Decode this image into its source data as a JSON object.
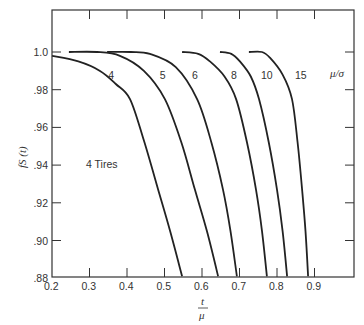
{
  "chart_data": {
    "type": "line",
    "title": "",
    "xlabel": "t/μ",
    "xlabel_num": "t",
    "xlabel_den": "μ",
    "ylabel": "fS (t)",
    "xlim": [
      0.2,
      1.005
    ],
    "ylim": [
      0.88,
      1.022
    ],
    "xticks": [
      0.2,
      0.3,
      0.4,
      0.5,
      0.6,
      0.7,
      0.8,
      0.9
    ],
    "xtick_labels": [
      "0.2",
      "0.3",
      "0.4",
      "0.5",
      "0.6",
      "0.7",
      "0.8",
      "0.9"
    ],
    "yticks": [
      1.0,
      0.98,
      0.96,
      0.94,
      0.92,
      0.9,
      0.88
    ],
    "ytick_labels": [
      "1.0",
      ".98",
      ".96",
      ".94",
      ".92",
      ".90",
      ".88"
    ],
    "grid": false,
    "legend_title": "μ/σ",
    "annotation": "4 Tires",
    "series": [
      {
        "name": "4",
        "label_pos": [
          0.35,
          0.988
        ],
        "x": [
          0.2,
          0.27,
          0.328,
          0.37,
          0.408,
          0.445,
          0.483,
          0.515,
          0.547
        ],
        "y": [
          0.998,
          0.995,
          0.99,
          0.983,
          0.975,
          0.953,
          0.927,
          0.905,
          0.881
        ]
      },
      {
        "name": "5",
        "label_pos": [
          0.487,
          0.988
        ],
        "x": [
          0.245,
          0.32,
          0.381,
          0.445,
          0.501,
          0.545,
          0.581,
          0.613,
          0.643
        ],
        "y": [
          1.0,
          1.0,
          0.998,
          0.99,
          0.975,
          0.952,
          0.927,
          0.905,
          0.881
        ]
      },
      {
        "name": "6",
        "label_pos": [
          0.573,
          0.988
        ],
        "x": [
          0.347,
          0.41,
          0.461,
          0.53,
          0.587,
          0.625,
          0.656,
          0.676,
          0.693
        ],
        "y": [
          1.0,
          1.0,
          0.999,
          0.992,
          0.975,
          0.952,
          0.927,
          0.905,
          0.881
        ]
      },
      {
        "name": "8",
        "label_pos": [
          0.677,
          0.988
        ],
        "x": [
          0.547,
          0.59,
          0.621,
          0.66,
          0.691,
          0.72,
          0.744,
          0.76,
          0.773
        ],
        "y": [
          1.0,
          0.999,
          0.995,
          0.987,
          0.975,
          0.952,
          0.927,
          0.905,
          0.881
        ]
      },
      {
        "name": "10",
        "label_pos": [
          0.757,
          0.988
        ],
        "x": [
          0.648,
          0.678,
          0.701,
          0.73,
          0.752,
          0.778,
          0.8,
          0.815,
          0.827
        ],
        "y": [
          1.0,
          0.999,
          0.995,
          0.987,
          0.975,
          0.952,
          0.927,
          0.905,
          0.881
        ]
      },
      {
        "name": "15",
        "label_pos": [
          0.848,
          0.988
        ],
        "x": [
          0.725,
          0.76,
          0.781,
          0.815,
          0.84,
          0.855,
          0.867,
          0.876,
          0.883
        ],
        "y": [
          1.0,
          1.0,
          0.997,
          0.988,
          0.975,
          0.952,
          0.927,
          0.905,
          0.881
        ]
      }
    ]
  }
}
